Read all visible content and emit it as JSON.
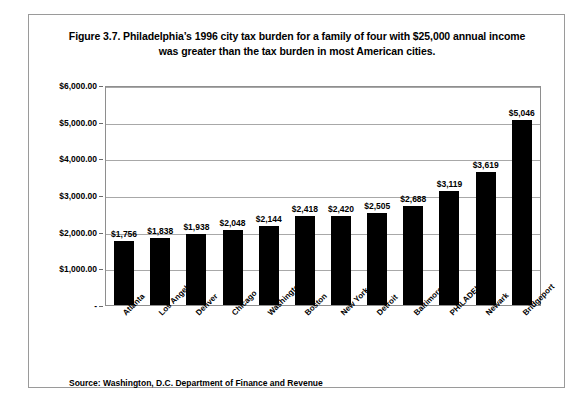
{
  "figure": {
    "title_line1": "Figure 3.7. Philadelphia’s 1996 city tax burden for a family of four with $25,000",
    "title_line2": "annual income was greater than the tax burden in most American cities.",
    "source": "Source: Washington, D.C. Department of Finance and Revenue"
  },
  "chart_data": {
    "type": "bar",
    "title": "Figure 3.7. Philadelphia’s 1996 city tax burden for a family of four with $25,000 annual income was greater than the tax burden in most American cities.",
    "xlabel": "",
    "ylabel": "",
    "ylim": [
      0,
      6000
    ],
    "grid": true,
    "legend": "none",
    "orientation": "vertical",
    "bar_color": "#000000",
    "categories": [
      "Atlanta",
      "Los Angeles",
      "Denver",
      "Chicago",
      "Washington DC",
      "Boston",
      "New York",
      "Detroit",
      "Baltimore",
      "PHILADELPHIA",
      "Newark",
      "Bridgeport"
    ],
    "values": [
      1756,
      1838,
      1938,
      2048,
      2144,
      2418,
      2420,
      2505,
      2688,
      3119,
      3619,
      5046
    ],
    "data_labels": [
      "$1,756",
      "$1,838",
      "$1,938",
      "$2,048",
      "$2,144",
      "$2,418",
      "$2,420",
      "$2,505",
      "$2,688",
      "$3,119",
      "$3,619",
      "$5,046"
    ],
    "ytick_values": [
      6000,
      5000,
      4000,
      3000,
      2000,
      1000,
      0
    ],
    "ytick_labels": [
      "$6,000.00",
      "$5,000.00",
      "$4,000.00",
      "$3,000.00",
      "$2,000.00",
      "$1,000.00",
      "-"
    ]
  }
}
